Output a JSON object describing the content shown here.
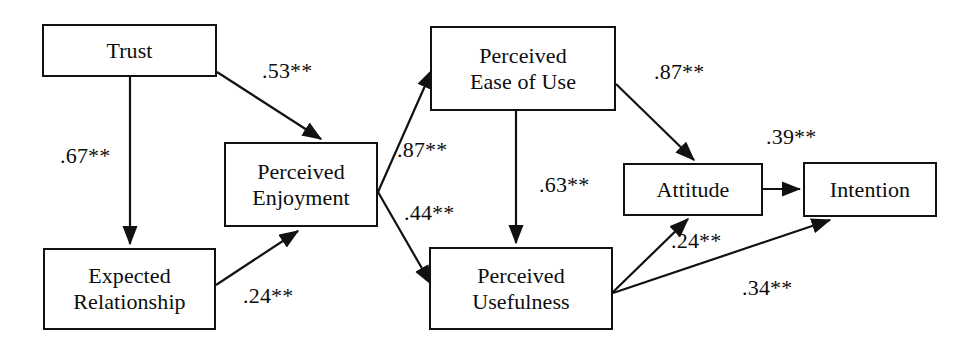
{
  "diagram": {
    "type": "path-diagram",
    "canvas": {
      "width": 978,
      "height": 356,
      "background": "#ffffff"
    },
    "stroke_color": "#111111",
    "text_color": "#0d0d0d",
    "nodes": [
      {
        "id": "trust",
        "label": "Trust",
        "x": 42,
        "y": 24,
        "w": 175,
        "h": 53
      },
      {
        "id": "expected_relationship",
        "label": "Expected\nRelationship",
        "x": 43,
        "y": 248,
        "w": 173,
        "h": 82
      },
      {
        "id": "perceived_enjoyment",
        "label": "Perceived\nEnjoyment",
        "x": 224,
        "y": 142,
        "w": 154,
        "h": 85
      },
      {
        "id": "perceived_ease_of_use",
        "label": "Perceived\nEase of Use",
        "x": 430,
        "y": 26,
        "w": 186,
        "h": 85
      },
      {
        "id": "perceived_usefulness",
        "label": "Perceived\nUsefulness",
        "x": 429,
        "y": 247,
        "w": 184,
        "h": 83
      },
      {
        "id": "attitude",
        "label": "Attitude",
        "x": 623,
        "y": 163,
        "w": 140,
        "h": 53
      },
      {
        "id": "intention",
        "label": "Intention",
        "x": 803,
        "y": 162,
        "w": 134,
        "h": 55
      }
    ],
    "edges": [
      {
        "id": "trust-to-enjoyment",
        "from": "trust",
        "to": "perceived_enjoyment",
        "coefficient": ".53**",
        "label_x": 262,
        "label_y": 58
      },
      {
        "id": "trust-to-expected-relationship",
        "from": "trust",
        "to": "expected_relationship",
        "coefficient": ".67**",
        "label_x": 60,
        "label_y": 143
      },
      {
        "id": "expected-relationship-to-enjoyment",
        "from": "expected_relationship",
        "to": "perceived_enjoyment",
        "coefficient": ".24**",
        "label_x": 243,
        "label_y": 283
      },
      {
        "id": "enjoyment-to-ease-of-use",
        "from": "perceived_enjoyment",
        "to": "perceived_ease_of_use",
        "coefficient": ".87**",
        "label_x": 397,
        "label_y": 137
      },
      {
        "id": "enjoyment-to-usefulness",
        "from": "perceived_enjoyment",
        "to": "perceived_usefulness",
        "coefficient": ".44**",
        "label_x": 404,
        "label_y": 200
      },
      {
        "id": "ease-of-use-to-usefulness",
        "from": "perceived_ease_of_use",
        "to": "perceived_usefulness",
        "coefficient": ".63**",
        "label_x": 539,
        "label_y": 172
      },
      {
        "id": "ease-of-use-to-attitude",
        "from": "perceived_ease_of_use",
        "to": "attitude",
        "coefficient": ".87**",
        "label_x": 654,
        "label_y": 59
      },
      {
        "id": "attitude-to-intention",
        "from": "attitude",
        "to": "intention",
        "coefficient": ".39**",
        "label_x": 766,
        "label_y": 124
      },
      {
        "id": "usefulness-to-attitude",
        "from": "perceived_usefulness",
        "to": "attitude",
        "coefficient": ".24**",
        "label_x": 671,
        "label_y": 228
      },
      {
        "id": "usefulness-to-intention",
        "from": "perceived_usefulness",
        "to": "intention",
        "coefficient": ".34**",
        "label_x": 742,
        "label_y": 275
      }
    ]
  }
}
